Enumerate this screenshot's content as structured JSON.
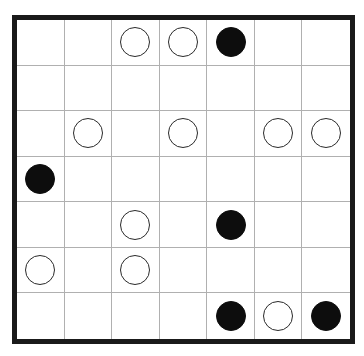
{
  "puzzle": {
    "type": "masyu",
    "rows": 7,
    "cols": 7,
    "colors": {
      "border": "#1a1a1a",
      "grid": "#b0b0b0",
      "white_pearl_fill": "#ffffff",
      "white_pearl_stroke": "#2a2a2a",
      "black_pearl_fill": "#0d0d0d"
    },
    "grid": [
      [
        "",
        "",
        "W",
        "W",
        "B",
        "",
        ""
      ],
      [
        "",
        "",
        "",
        "",
        "",
        "",
        ""
      ],
      [
        "",
        "W",
        "",
        "W",
        "",
        "W",
        "W"
      ],
      [
        "B",
        "",
        "",
        "",
        "",
        "",
        ""
      ],
      [
        "",
        "",
        "W",
        "",
        "B",
        "",
        ""
      ],
      [
        "W",
        "",
        "W",
        "",
        "",
        "",
        ""
      ],
      [
        "",
        "",
        "",
        "",
        "B",
        "W",
        "B"
      ]
    ],
    "legend": {
      "W": "white-pearl",
      "B": "black-pearl"
    }
  }
}
